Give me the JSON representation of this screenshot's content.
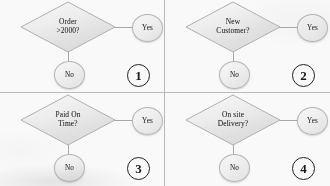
{
  "diagram": {
    "type": "flowchart-decision-grid",
    "background_color": "#fdfdfd",
    "divider_color": "#b9b9b9",
    "connector_color": "#a8a8a8",
    "shape_border_color": "#b5b5b5",
    "text_color": "#2b2b2b",
    "quadrants": [
      {
        "number": "①",
        "number_plain": "1",
        "decision": "Order\n>2000?",
        "yes_label": "Yes",
        "no_label": "No"
      },
      {
        "number": "②",
        "number_plain": "2",
        "decision": "New\nCustomer?",
        "yes_label": "Yes",
        "no_label": "No"
      },
      {
        "number": "③",
        "number_plain": "3",
        "decision": "Paid On\nTime?",
        "yes_label": "Yes",
        "no_label": "No"
      },
      {
        "number": "④",
        "number_plain": "4",
        "decision": "On site\nDelivery?",
        "yes_label": "Yes",
        "no_label": "No"
      }
    ]
  }
}
